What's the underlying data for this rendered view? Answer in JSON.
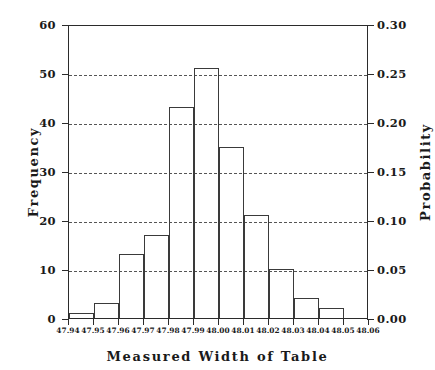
{
  "chart_data": {
    "type": "bar",
    "title": "",
    "xlabel": "Measured Width of Table",
    "ylabel": "Frequency",
    "ylabel_right": "Probability",
    "bin_edges": [
      47.94,
      47.95,
      47.96,
      47.97,
      47.98,
      47.99,
      48.0,
      48.01,
      48.02,
      48.03,
      48.04,
      48.05,
      48.06
    ],
    "categories": [
      "47.94-47.95",
      "47.95-47.96",
      "47.96-47.97",
      "47.97-47.98",
      "47.98-47.99",
      "47.99-48.00",
      "48.00-48.01",
      "48.01-48.02",
      "48.02-48.03",
      "48.03-48.04",
      "48.04-48.05",
      "48.05-48.06"
    ],
    "values": [
      1,
      3,
      13,
      17,
      43,
      51,
      35,
      21,
      10,
      4,
      2,
      0
    ],
    "probabilities": [
      0.005,
      0.015,
      0.065,
      0.085,
      0.215,
      0.255,
      0.175,
      0.105,
      0.05,
      0.02,
      0.01,
      0.0
    ],
    "xlim": [
      47.94,
      48.06
    ],
    "ylim": [
      0,
      60
    ],
    "ylim_right": [
      0.0,
      0.3
    ],
    "grid": true,
    "grid_orientation": "horizontal",
    "grid_style": "dashed",
    "legend": "none",
    "total_count": 200,
    "x_ticks": [
      "47.94",
      "47.95",
      "47.96",
      "47.97",
      "47.98",
      "47.99",
      "48.00",
      "48.01",
      "48.02",
      "48.03",
      "48.04",
      "48.05",
      "48.06"
    ],
    "x_tick_values": [
      47.94,
      47.95,
      47.96,
      47.97,
      47.98,
      47.99,
      48.0,
      48.01,
      48.02,
      48.03,
      48.04,
      48.05,
      48.06
    ],
    "y_ticks_left": [
      "0",
      "10",
      "20",
      "30",
      "40",
      "50",
      "60"
    ],
    "y_tick_values_left": [
      0,
      10,
      20,
      30,
      40,
      50,
      60
    ],
    "y_ticks_right": [
      "0.00",
      "0.05",
      "0.10",
      "0.15",
      "0.20",
      "0.25",
      "0.30"
    ],
    "y_tick_values_right": [
      0.0,
      0.05,
      0.1,
      0.15,
      0.2,
      0.25,
      0.3
    ],
    "colors": {
      "bar_edge": "#3a3a3a",
      "bar_fill": "transparent",
      "axis": "#2b2b2b",
      "grid": "#555555",
      "text": "#1a1a1a",
      "background": "#ffffff"
    }
  }
}
